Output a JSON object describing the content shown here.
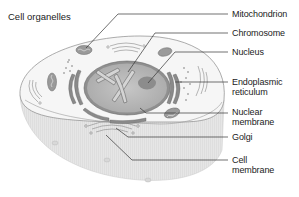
{
  "diagram": {
    "title": "Cell organelles",
    "labels": [
      {
        "id": "mitochondrion",
        "lines": [
          "Mitochondrion"
        ]
      },
      {
        "id": "chromosome",
        "lines": [
          "Chromosome"
        ]
      },
      {
        "id": "nucleus",
        "lines": [
          "Nucleus"
        ]
      },
      {
        "id": "endoplasmic-reticulum",
        "lines": [
          "Endoplasmic",
          "reticulum"
        ]
      },
      {
        "id": "nuclear-membrane",
        "lines": [
          "Nuclear",
          "membrane"
        ]
      },
      {
        "id": "golgi",
        "lines": [
          "Golgi"
        ]
      },
      {
        "id": "cell-membrane",
        "lines": [
          "Cell",
          "membrane"
        ]
      }
    ],
    "colors": {
      "cell_top": "#f4f4f4",
      "cell_side": "#e2e2e2",
      "nucleus_fill": "#b9b9b9",
      "nucleolus": "#8c8c8c",
      "organelle_dark": "#7a7a7a",
      "line": "#333333"
    }
  }
}
